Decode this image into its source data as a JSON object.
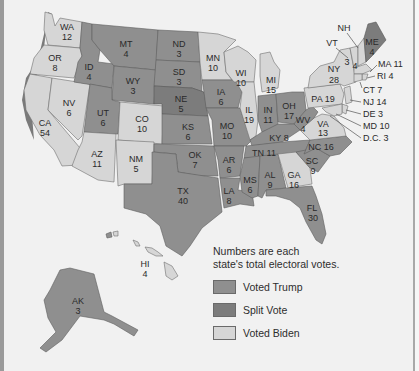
{
  "colors": {
    "voted_trump": "#8f8f8f",
    "split_vote": "#7c7c7c",
    "voted_biden": "#d6d6d6",
    "background": "#f1f1f1"
  },
  "legend": {
    "note_line1": "Numbers are each",
    "note_line2": "state's total electoral votes.",
    "items": [
      {
        "label": "Voted Trump",
        "category": "trump"
      },
      {
        "label": "Split Vote",
        "category": "split"
      },
      {
        "label": "Voted Biden",
        "category": "biden"
      }
    ]
  },
  "states": {
    "WA": {
      "abbr": "WA",
      "votes": "12",
      "result": "biden"
    },
    "OR": {
      "abbr": "OR",
      "votes": "8",
      "result": "biden"
    },
    "CA": {
      "abbr": "CA",
      "votes": "54",
      "result": "biden"
    },
    "NV": {
      "abbr": "NV",
      "votes": "6",
      "result": "biden"
    },
    "ID": {
      "abbr": "ID",
      "votes": "4",
      "result": "trump"
    },
    "MT": {
      "abbr": "MT",
      "votes": "4",
      "result": "trump"
    },
    "WY": {
      "abbr": "WY",
      "votes": "3",
      "result": "trump"
    },
    "UT": {
      "abbr": "UT",
      "votes": "6",
      "result": "trump"
    },
    "AZ": {
      "abbr": "AZ",
      "votes": "11",
      "result": "biden"
    },
    "CO": {
      "abbr": "CO",
      "votes": "10",
      "result": "biden"
    },
    "NM": {
      "abbr": "NM",
      "votes": "5",
      "result": "biden"
    },
    "ND": {
      "abbr": "ND",
      "votes": "3",
      "result": "trump"
    },
    "SD": {
      "abbr": "SD",
      "votes": "3",
      "result": "trump"
    },
    "NE": {
      "abbr": "NE",
      "votes": "5",
      "result": "split"
    },
    "KS": {
      "abbr": "KS",
      "votes": "6",
      "result": "trump"
    },
    "OK": {
      "abbr": "OK",
      "votes": "7",
      "result": "trump"
    },
    "TX": {
      "abbr": "TX",
      "votes": "40",
      "result": "trump"
    },
    "MN": {
      "abbr": "MN",
      "votes": "10",
      "result": "biden"
    },
    "IA": {
      "abbr": "IA",
      "votes": "6",
      "result": "trump"
    },
    "MO": {
      "abbr": "MO",
      "votes": "10",
      "result": "trump"
    },
    "AR": {
      "abbr": "AR",
      "votes": "6",
      "result": "trump"
    },
    "LA": {
      "abbr": "LA",
      "votes": "8",
      "result": "trump"
    },
    "WI": {
      "abbr": "WI",
      "votes": "10",
      "result": "biden"
    },
    "IL": {
      "abbr": "IL",
      "votes": "19",
      "result": "biden"
    },
    "MI": {
      "abbr": "MI",
      "votes": "15",
      "result": "biden"
    },
    "IN": {
      "abbr": "IN",
      "votes": "11",
      "result": "trump"
    },
    "OH": {
      "abbr": "OH",
      "votes": "17",
      "result": "trump"
    },
    "KY": {
      "abbr": "KY",
      "votes": "8",
      "result": "trump"
    },
    "TN": {
      "abbr": "TN",
      "votes": "11",
      "result": "trump"
    },
    "MS": {
      "abbr": "MS",
      "votes": "6",
      "result": "trump"
    },
    "AL": {
      "abbr": "AL",
      "votes": "9",
      "result": "trump"
    },
    "GA": {
      "abbr": "GA",
      "votes": "16",
      "result": "biden"
    },
    "FL": {
      "abbr": "FL",
      "votes": "30",
      "result": "trump"
    },
    "SC": {
      "abbr": "SC",
      "votes": "9",
      "result": "trump"
    },
    "NC": {
      "abbr": "NC",
      "votes": "16",
      "result": "trump"
    },
    "VA": {
      "abbr": "VA",
      "votes": "13",
      "result": "biden"
    },
    "WV": {
      "abbr": "WV",
      "votes": "4",
      "result": "trump"
    },
    "PA": {
      "abbr": "PA",
      "votes": "19",
      "result": "biden"
    },
    "NY": {
      "abbr": "NY",
      "votes": "28",
      "result": "biden"
    },
    "VT": {
      "abbr": "VT",
      "votes": "3",
      "result": "biden"
    },
    "NH": {
      "abbr": "NH",
      "votes": "4",
      "result": "biden"
    },
    "ME": {
      "abbr": "ME",
      "votes": "4",
      "result": "split"
    },
    "MA": {
      "abbr": "MA",
      "votes": "11",
      "result": "biden"
    },
    "RI": {
      "abbr": "RI",
      "votes": "4",
      "result": "biden"
    },
    "CT": {
      "abbr": "CT",
      "votes": "7",
      "result": "biden"
    },
    "NJ": {
      "abbr": "NJ",
      "votes": "14",
      "result": "biden"
    },
    "DE": {
      "abbr": "DE",
      "votes": "3",
      "result": "biden"
    },
    "MD": {
      "abbr": "MD",
      "votes": "10",
      "result": "biden"
    },
    "DC": {
      "abbr": "D.C.",
      "votes": "3",
      "result": "biden"
    },
    "AK": {
      "abbr": "AK",
      "votes": "3",
      "result": "trump"
    },
    "HI": {
      "abbr": "HI",
      "votes": "4",
      "result": "biden"
    }
  },
  "callouts": {
    "MA": "MA  11",
    "RI": "RI  4",
    "CT": "CT  7",
    "NJ": "NJ  14",
    "DE": "DE  3",
    "MD": "MD  10",
    "DC": "D.C.  3",
    "KY": "KY 8",
    "TN": "TN 11",
    "NC": "NC 16",
    "PA": "PA 19"
  }
}
